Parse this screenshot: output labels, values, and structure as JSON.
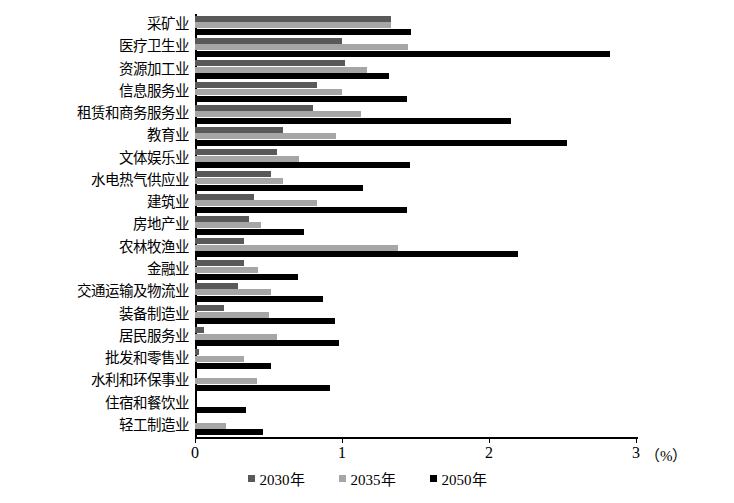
{
  "chart_data": {
    "type": "bar",
    "orientation": "horizontal",
    "title": "",
    "xlabel": "（%）",
    "ylabel": "",
    "xlim": [
      0,
      3
    ],
    "xticks": [
      "0",
      "1",
      "2",
      "3"
    ],
    "unit_label": "（%）",
    "grid": false,
    "legend_position": "bottom",
    "categories": [
      "采矿业",
      "医疗卫生业",
      "资源加工业",
      "信息服务业",
      "租赁和商务服务业",
      "教育业",
      "文体娱乐业",
      "水电热气供应业",
      "建筑业",
      "房地产业",
      "农林牧渔业",
      "金融业",
      "交通运输及物流业",
      "装备制造业",
      "居民服务业",
      "批发和零售业",
      "水利和环保事业",
      "住宿和餐饮业",
      "轻工制造业"
    ],
    "series": [
      {
        "name": "2030年",
        "color": "#595959",
        "values": [
          1.33,
          1.0,
          1.02,
          0.83,
          0.8,
          0.6,
          0.56,
          0.52,
          0.4,
          0.37,
          0.33,
          0.33,
          0.29,
          0.2,
          0.06,
          0.03,
          0.0,
          0.0,
          0.0
        ]
      },
      {
        "name": "2035年",
        "color": "#a6a6a6",
        "values": [
          1.33,
          1.45,
          1.17,
          1.0,
          1.13,
          0.96,
          0.71,
          0.6,
          0.83,
          0.45,
          1.38,
          0.43,
          0.52,
          0.5,
          0.56,
          0.33,
          0.42,
          0.0,
          0.21
        ]
      },
      {
        "name": "2050年",
        "color": "#000000",
        "values": [
          1.47,
          2.82,
          1.32,
          1.44,
          2.15,
          2.53,
          1.46,
          1.14,
          1.44,
          0.74,
          2.2,
          0.7,
          0.87,
          0.95,
          0.98,
          0.52,
          0.92,
          0.35,
          0.46
        ]
      }
    ]
  },
  "legend": {
    "items": [
      {
        "label": "2030年",
        "color": "#595959"
      },
      {
        "label": "2035年",
        "color": "#a6a6a6"
      },
      {
        "label": "2050年",
        "color": "#000000"
      }
    ]
  },
  "axis": {
    "unit": "（%）",
    "ticks": [
      "0",
      "1",
      "2",
      "3"
    ]
  }
}
